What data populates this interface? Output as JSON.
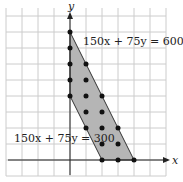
{
  "chart_data": {
    "type": "scatter",
    "title": "",
    "xlabel": "x",
    "ylabel": "y",
    "grid": true,
    "xlim": [
      -4,
      6
    ],
    "ylim": [
      -1,
      10
    ],
    "region": {
      "vertices": [
        [
          0,
          4
        ],
        [
          0,
          8
        ],
        [
          4,
          0
        ],
        [
          2,
          0
        ]
      ],
      "fill": "#b5b5b5"
    },
    "lines": [
      {
        "label": "150x + 75y = 600",
        "points": [
          [
            0,
            8
          ],
          [
            4,
            0
          ]
        ]
      },
      {
        "label": "150x + 75y = 300",
        "points": [
          [
            0,
            4
          ],
          [
            2,
            0
          ]
        ]
      }
    ],
    "points": [
      [
        0,
        4
      ],
      [
        0,
        5
      ],
      [
        0,
        6
      ],
      [
        0,
        7
      ],
      [
        0,
        8
      ],
      [
        1,
        2
      ],
      [
        1,
        3
      ],
      [
        1,
        4
      ],
      [
        1,
        5
      ],
      [
        1,
        6
      ],
      [
        2,
        0
      ],
      [
        2,
        1
      ],
      [
        2,
        2
      ],
      [
        2,
        3
      ],
      [
        2,
        4
      ],
      [
        3,
        0
      ],
      [
        3,
        1
      ],
      [
        3,
        2
      ],
      [
        4,
        0
      ]
    ]
  },
  "labels": {
    "x": "x",
    "y": "y",
    "line1": "150x + 75y = 600",
    "line2": "150x + 75y = 300"
  }
}
